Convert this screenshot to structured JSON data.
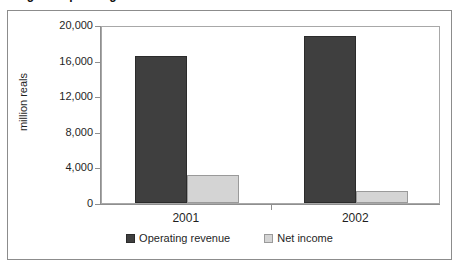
{
  "figure": {
    "title_clipped": "Figure: Operating revenue and net income",
    "frame_visible": true
  },
  "chart_data": {
    "type": "bar",
    "title": "",
    "categories": [
      "2001",
      "2002"
    ],
    "series": [
      {
        "name": "Operating revenue",
        "values": [
          16500,
          18750
        ],
        "color": "#3f3f3f"
      },
      {
        "name": "Net income",
        "values": [
          3200,
          1350
        ],
        "color": "#d4d4d4"
      }
    ],
    "xlabel": "",
    "ylabel": "million reals",
    "ylim": [
      0,
      20000
    ],
    "yticks": [
      0,
      4000,
      8000,
      12000,
      16000,
      20000
    ],
    "ytick_labels": [
      "0",
      "4,000",
      "8,000",
      "12,000",
      "16,000",
      "20,000"
    ],
    "grid": false,
    "legend_position": "bottom"
  }
}
